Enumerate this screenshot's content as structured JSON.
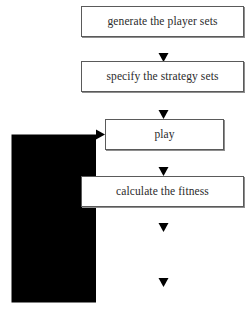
{
  "diagram": {
    "background_color": "#ffffff",
    "box_border_color": "#5a5a5a",
    "box_fill_color": "#ffffff",
    "arrow_color": "#4a4a4a",
    "text_color": "#2b2b2b"
  },
  "nodes": [
    {
      "id": "generate",
      "label": "generate the player sets"
    },
    {
      "id": "specify",
      "label": "specify the strategy sets"
    },
    {
      "id": "play",
      "label": "play"
    },
    {
      "id": "calculate",
      "label": "calculate the fitness"
    },
    {
      "id": "selection",
      "label": "selection"
    },
    {
      "id": "crossover",
      "label": "crossover"
    }
  ],
  "edges": [
    {
      "id": "e1",
      "from": "generate",
      "to": "specify",
      "kind": "straight-down",
      "arrowhead": true
    },
    {
      "id": "e2",
      "from": "specify",
      "to": "play",
      "kind": "straight-down",
      "arrowhead": true
    },
    {
      "id": "e3",
      "from": "play",
      "to": "calculate",
      "kind": "straight-down",
      "arrowhead": true
    },
    {
      "id": "e4",
      "from": "calculate",
      "to": "selection",
      "kind": "straight-down",
      "arrowhead": true
    },
    {
      "id": "e5",
      "from": "selection",
      "to": "crossover",
      "kind": "straight-down",
      "arrowhead": true
    },
    {
      "id": "e6",
      "from": "crossover",
      "to": "play",
      "kind": "feedback-loop-left",
      "arrowhead": true
    }
  ]
}
